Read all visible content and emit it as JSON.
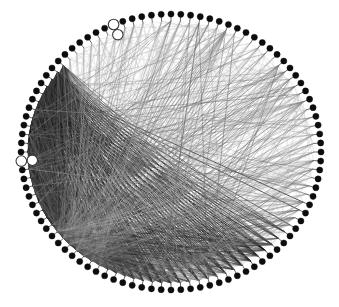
{
  "figure": {
    "type": "circular-node-link-diagram",
    "width": 339,
    "height": 307,
    "background_color": "#ffffff"
  },
  "chart_data": {
    "type": "graph",
    "layout": "circular",
    "title": "",
    "xlabel": "",
    "ylabel": "",
    "grid": false,
    "legend": null,
    "annotations": [],
    "geometry": {
      "center_x": 171,
      "center_y": 152,
      "radius_x": 157,
      "radius_y": 144,
      "node_ring_radius_x": 150,
      "node_ring_radius_y": 138,
      "stem_length": 7,
      "start_angle_deg": -90,
      "direction": "clockwise"
    },
    "style": {
      "node_fill": "#0d0d0d",
      "node_hollow_fill": "#ffffff",
      "node_stroke": "#0d0d0d",
      "node_radius": 3.1,
      "edge_color_dark": "#1a1a1a",
      "edge_color_mid": "#6e6e6e",
      "edge_color_light": "#b4b4b4",
      "edge_width_min": 0.28,
      "edge_width_max": 0.75
    },
    "node_count": 96,
    "hollow_node_indices": [
      71,
      90
    ],
    "hub_nodes": [
      {
        "index": 58,
        "label": "lower-left-hub",
        "degree": 86
      },
      {
        "index": 80,
        "label": "right-hub",
        "degree": 92
      },
      {
        "index": 62,
        "label": "lower-left-hub-2",
        "degree": 54
      },
      {
        "index": 78,
        "label": "right-hub-2",
        "degree": 46
      }
    ],
    "edge_bundles": [
      {
        "from": 58,
        "to_range": [
          0,
          48
        ],
        "weight": 0.55,
        "shade": "mid"
      },
      {
        "from": 58,
        "to_range": [
          49,
          95
        ],
        "weight": 0.4,
        "shade": "light"
      },
      {
        "from": 62,
        "to_range": [
          4,
          44
        ],
        "weight": 0.45,
        "shade": "light"
      },
      {
        "from": 80,
        "to_range": [
          30,
          78
        ],
        "weight": 0.95,
        "shade": "dark"
      },
      {
        "from": 80,
        "to_range": [
          0,
          29
        ],
        "weight": 0.35,
        "shade": "mid"
      },
      {
        "from": 78,
        "to_range": [
          34,
          76
        ],
        "weight": 0.85,
        "shade": "dark"
      },
      {
        "from": 82,
        "to_range": [
          36,
          74
        ],
        "weight": 0.8,
        "shade": "dark"
      },
      {
        "from": 76,
        "to_range": [
          38,
          72
        ],
        "weight": 0.7,
        "shade": "dark"
      },
      {
        "from": 6,
        "to_range": [
          52,
          70
        ],
        "weight": 0.5,
        "shade": "mid"
      },
      {
        "from": 18,
        "to_range": [
          54,
          72
        ],
        "weight": 0.45,
        "shade": "mid"
      }
    ]
  }
}
